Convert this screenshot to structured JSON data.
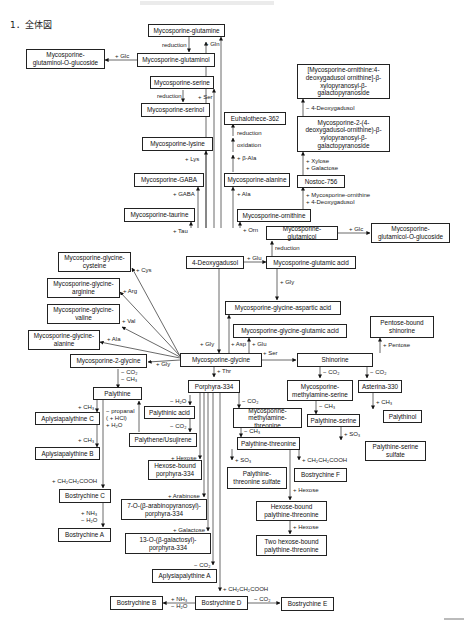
{
  "heading": "1．全体図",
  "nodes": {
    "myc_glutamine": "Mycosporine-glutamine",
    "myc_glutaminol": "Mycosporine-glutaminol",
    "myc_glutaminol_glc": "Mycosporine-\nglutaminol-O-glucoside",
    "myc_serine": "Mycosporine-serine",
    "myc_serinol": "Mycosporine-serinol",
    "myc_lysine": "Mycosporine-lysine",
    "myc_gaba": "Mycosporine-GABA",
    "myc_taurine": "Mycosporine-taurine",
    "euhalothece": "Euhalothece-362",
    "myc_alanine": "Mycosporine-alanine",
    "myc_ornithine": "Mycosporine-ornithine",
    "nostoc": "Nostoc-756",
    "orn_xylo_1": "[Mycosporine-ornithine:4-\ndeoxygadusol ornithine]-β-\nxylopyranosyl-β-\ngalactopyranoside",
    "orn_xylo_2": "Mycosporine-2-(4-\ndeoxygadusol-ornithine)-β-\nxylopyranosyl-β-\ngalactopyranoside",
    "myc_glutamicol": "Mycosporine-glutamicol",
    "myc_glutamicol_glc": "Mycosporine-\nglutamicol-O-glucoside",
    "deoxygadusol": "4-Deoxygadusol",
    "myc_glutamic": "Mycosporine-glutamic acid",
    "mg_cysteine": "Mycosporine-glycine-\ncysteine",
    "mg_arginine": "Mycosporine-glycine-\narginine",
    "mg_valine": "Mycosporine-glycine-\nvaline",
    "mg_alanine": "Mycosporine-glycine-\nalanine",
    "mg_aspartic": "Mycosporine-glycine-aspartic acid",
    "mg_glutamic": "Mycosporine-glycine-glutamic acid",
    "pentose_shinorine": "Pentose-bound\nshinorine",
    "myc_2_glycine": "Mycosporine-2-glycine",
    "myc_glycine": "Mycosporine-glycine",
    "shinorine": "Shinorine",
    "palythine": "Palythine",
    "porphyra": "Porphyra-334",
    "mma_serine": "Mycosporine-\nmethylamine-serine",
    "asterina": "Asterina-330",
    "aplysia_c": "Aplysiapalythine C",
    "palythinic": "Palythinic acid",
    "mma_threonine": "Mycosporine-\nmethylamine-threonine",
    "palythine_serine": "Palythine-serine",
    "palythinol": "Palythinol",
    "palythene": "Palythene/Usujirene",
    "aplysia_b": "Aplysiapalythine B",
    "palythine_threonine": "Palythine-threonine",
    "pal_ser_sulfate": "Palythine-serine\nsulfate",
    "hexose_porphyra": "Hexose-bound\nporphyra-334",
    "pal_thr_sulfate": "Palythine-\nthreonine sulfate",
    "bostrychine_f": "Bostrychine F",
    "bostrychine_c": "Bostrychine C",
    "hexose_pal_thr": "Hexose-bound\npalythine-threonine",
    "arabino_porphyra": "7-O-(β-arabinopyranosyl)-\nporphyra-334",
    "bostrychine_a": "Bostrychine A",
    "two_hexose": "Two hexose-bound\npalythine-threonine",
    "galacto_porphyra": "13-O-(β-galactosyl)-\nporphyra-334",
    "aplysia_a": "Aplysiapalythine A",
    "bostrychine_b": "Bostrychine B",
    "bostrychine_d": "Bostrychine D",
    "bostrychine_e": "Bostrychine E"
  },
  "labels": {
    "reduction_gln": "reduction",
    "plus_gln": "+ Gln",
    "plus_glc_1": "+ Glc",
    "reduction_ser": "reduction",
    "plus_ser_1": "+ Ser",
    "plus_lys": "+ Lys",
    "plus_gaba": "+ GABA",
    "plus_tau": "+ Tau",
    "reduction_eu": "reduction",
    "oxidation_eu": "oxidation",
    "plus_bala": "+ β-Ala",
    "plus_ala_1": "+ Ala",
    "plus_orn": "+ Orn",
    "minus_deoxy": "− 4-Deoxygadusol",
    "plus_xyl_gal": "+ Xylose\n+ Galactose",
    "plus_orn_deoxy": "+ Mycosporine-ornithine\n+ 4-Deoxygadusol",
    "plus_glc_2": "+ Glc",
    "reduction_glu": "reduction",
    "plus_glu_1": "+ Glu",
    "plus_gly_1": "+ Gly",
    "plus_cys": "+ Cys",
    "plus_arg": "+ Arg",
    "plus_val": "+ Val",
    "plus_ala_2": "+ Ala",
    "plus_gly_2": "+ Gly",
    "plus_gly_3": "+ Gly",
    "plus_asp": "+ Asp",
    "plus_glu_2": "+ Glu",
    "plus_ser_2": "+ Ser",
    "plus_pentose": "+ Pentose",
    "plus_thr": "+ Thr",
    "minus_co2_ch3": "− CO₂\n− CH₃",
    "minus_co2_shin": "− CO₂",
    "minus_co2_ast": "− CO₂",
    "plus_ch3_c": "+ CH₃",
    "propanal": "− propanal\n( + HCl)\n+ H₂O",
    "minus_h2o": "− H₂O",
    "minus_co2_pal": "− CO₂",
    "minus_co2_mma": "− CO₂",
    "minus_ch3_ser": "− CH₃",
    "plus_ch3_ast": "+ CH₃",
    "plus_ch3_b": "+ CH₃",
    "minus_ch3_thr": "− CH₃",
    "plus_so3_ser": "+ SO₃",
    "plus_so3_thr": "+ SO₃",
    "plus_cooh_f": "+ CH₂CH₂COOH",
    "plus_hexose_p": "+ Hexose",
    "plus_cooh_c": "+ CH₂CH₂COOH",
    "plus_hexose_t": "+ Hexose",
    "plus_arabinose": "+ Arabinose",
    "plus_nh3_a": "+ NH₃\n− H₂O",
    "plus_hexose_t2": "+ Hexose",
    "plus_galactose": "+ Galactose",
    "minus_co2_a": "− CO₂",
    "plus_cooh_d": "+ CH₂CH₂COOH",
    "plus_nh3_b": "+ NH₃\n− H₂O",
    "minus_co2_e": "− CO₂"
  },
  "colors": {
    "line": "#333333",
    "box_border": "#222222",
    "background": "#ffffff"
  }
}
